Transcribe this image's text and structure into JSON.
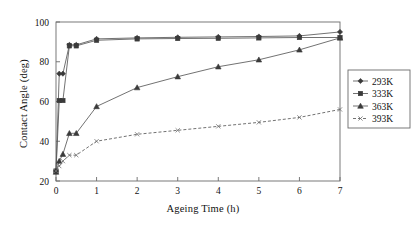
{
  "chart_data": {
    "type": "line",
    "title": "",
    "xlabel": "Ageing Time (h)",
    "ylabel": "Contact Angle (deg)",
    "xlim": [
      0,
      7
    ],
    "ylim": [
      20,
      100
    ],
    "xticks": [
      "0",
      "1",
      "2",
      "3",
      "4",
      "5",
      "6",
      "7"
    ],
    "yticks": [
      "20",
      "40",
      "60",
      "80",
      "100"
    ],
    "grid": false,
    "legend_position": "right-outside",
    "x": [
      0,
      0.08,
      0.17,
      0.33,
      0.5,
      1,
      2,
      3,
      4,
      5,
      6,
      7
    ],
    "series": [
      {
        "name": "293K",
        "marker": "diamond",
        "linestyle": "solid",
        "color": "#3a3a3a",
        "values": [
          25,
          74,
          74,
          88.5,
          88.5,
          91.5,
          92,
          92.3,
          92.5,
          92.7,
          93,
          95
        ]
      },
      {
        "name": "333K",
        "marker": "square",
        "linestyle": "solid",
        "color": "#3a3a3a",
        "values": [
          25,
          60.5,
          60.5,
          88,
          88,
          90.8,
          91.5,
          91.7,
          91.8,
          92,
          92.2,
          92.2
        ]
      },
      {
        "name": "363K",
        "marker": "triangle",
        "linestyle": "solid",
        "color": "#3a3a3a",
        "values": [
          24.5,
          30,
          33.5,
          44,
          44,
          57.5,
          67,
          72.5,
          77.5,
          81,
          86,
          92
        ]
      },
      {
        "name": "393K",
        "marker": "x",
        "linestyle": "dashed",
        "color": "#6e6e6e",
        "values": [
          25,
          27.5,
          30,
          33,
          33,
          40,
          43.5,
          45.5,
          47.5,
          49.5,
          52,
          56
        ]
      }
    ],
    "legend": [
      {
        "label": "293K",
        "marker": "diamond",
        "linestyle": "solid"
      },
      {
        "label": "333K",
        "marker": "square",
        "linestyle": "solid"
      },
      {
        "label": "363K",
        "marker": "triangle",
        "linestyle": "solid"
      },
      {
        "label": "393K",
        "marker": "x",
        "linestyle": "dashed"
      }
    ]
  },
  "axes": {
    "x_title": "Ageing Time (h)",
    "y_title": "Contact Angle (deg)"
  },
  "colors": {
    "frame": "#6b6b6b",
    "line": "#585858",
    "marker": "#3a3a3a",
    "dashed": "#6e6e6e",
    "background": "#ffffff"
  }
}
